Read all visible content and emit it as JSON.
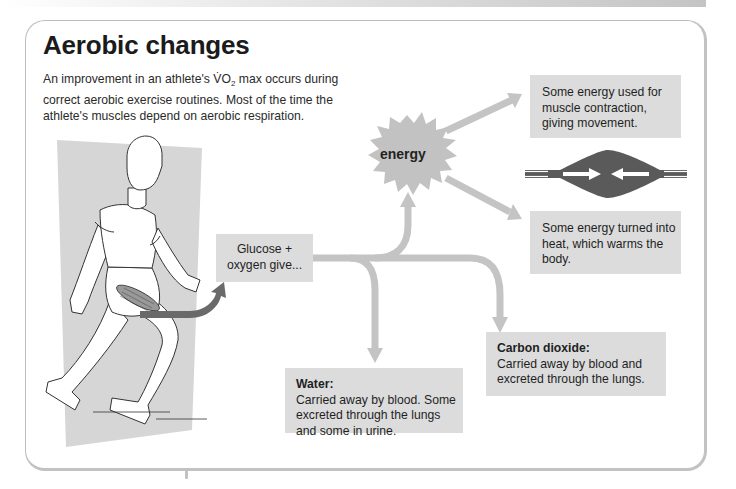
{
  "header": {
    "title": "Aerobic changes",
    "intro_part1": "An improvement in an athlete's V̇O",
    "intro_sub": "2",
    "intro_part2": " max occurs during correct aerobic exercise routines. Most of the time the athlete's muscles depend on aerobic respiration."
  },
  "diagram": {
    "input": {
      "label": "Glucose + oxygen give..."
    },
    "energy": {
      "label": "energy",
      "shape": "starburst"
    },
    "outputs": [
      {
        "id": "contraction",
        "text": "Some energy used for muscle contraction, giving movement."
      },
      {
        "id": "heat",
        "text": "Some energy turned into heat, which warms the body."
      },
      {
        "id": "carbon-dioxide",
        "title": "Carbon dioxide:",
        "text": "Carried away by blood and excreted through the lungs."
      },
      {
        "id": "water",
        "title": "Water:",
        "text": "Carried away by blood. Some excreted through the lungs and some in urine."
      }
    ],
    "illustrations": [
      "running-athlete",
      "contracting-muscle"
    ],
    "colors": {
      "box_fill": "#dcdcdc",
      "arrow": "#c4c4c4",
      "muscle_arrow": "#6a6a6a",
      "muscle": "#5a5a5a",
      "athlete_bg": "#d6d6d6"
    }
  }
}
